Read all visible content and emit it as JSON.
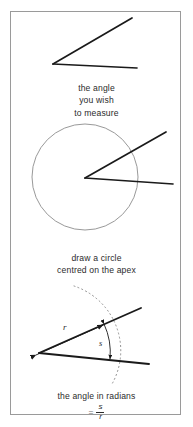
{
  "figure": {
    "border_color": "#9a9a9a",
    "background": "#ffffff",
    "ink_color": "#1a1a1a",
    "guide_color": "#8d8d8d",
    "text_color": "#2b2b2b"
  },
  "panels": [
    {
      "id": "panel-1",
      "caption_lines": [
        "the angle",
        "you wish",
        "to measure"
      ],
      "shapes": {
        "apex": [
          52,
          63
        ],
        "ray_upper_end": [
          131,
          17
        ],
        "ray_lower_end": [
          136,
          67
        ]
      }
    },
    {
      "id": "panel-2",
      "caption_lines": [
        "draw a circle",
        "centred on the apex"
      ],
      "shapes": {
        "apex": [
          84,
          176
        ],
        "circle_center": [
          84,
          175
        ],
        "circle_radius": 53,
        "ray_upper_end": [
          165,
          130
        ],
        "ray_lower_end": [
          172,
          182
        ]
      }
    },
    {
      "id": "panel-3",
      "caption_lines": [
        "the angle in radians"
      ],
      "formula": {
        "equals": "=",
        "numerator": "s",
        "denominator": "r",
        "plain": "= s / r"
      },
      "labels": {
        "radius": "r",
        "arc": "s"
      },
      "shapes": {
        "apex": [
          38,
          341
        ],
        "ray_upper_end": [
          140,
          296
        ],
        "ray_lower_end": [
          148,
          352
        ],
        "arc_radius": 68
      }
    }
  ]
}
